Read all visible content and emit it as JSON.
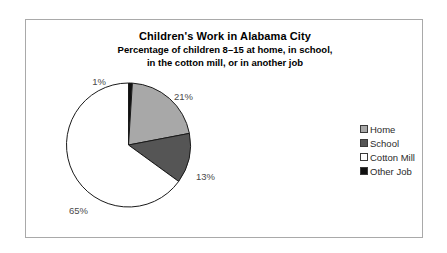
{
  "chart_data": {
    "type": "pie",
    "title": "Children's Work in Alabama City",
    "subtitle_line1": "Percentage of children 8–15 at home, in school,",
    "subtitle_line2": "in the cotton mill, or in another job",
    "categories": [
      "Home",
      "School",
      "Cotton Mill",
      "Other Job"
    ],
    "values": [
      21,
      13,
      65,
      1
    ],
    "value_labels": [
      "21%",
      "13%",
      "65%",
      "1%"
    ],
    "colors": [
      "#a8a8a8",
      "#555555",
      "#ffffff",
      "#101010"
    ],
    "slice_order_clockwise_from_top": [
      "Other Job",
      "Home",
      "School",
      "Cotton Mill"
    ],
    "start_angle_deg": 0,
    "legend_position": "right",
    "grid": false,
    "units": "percent",
    "total": 100
  },
  "legend": {
    "items": [
      {
        "label": "Home",
        "color": "#a8a8a8"
      },
      {
        "label": "School",
        "color": "#555555"
      },
      {
        "label": "Cotton Mill",
        "color": "#ffffff"
      },
      {
        "label": "Other Job",
        "color": "#101010"
      }
    ]
  },
  "labels": {
    "pct_other_job": "1%",
    "pct_home": "21%",
    "pct_school": "13%",
    "pct_cotton_mill": "65%"
  },
  "style": {
    "frame_border_color": "#a9a9a9",
    "slice_outline_color": "#1a1a1a",
    "label_text_color": "#4a4a4a",
    "background": "#ffffff"
  }
}
